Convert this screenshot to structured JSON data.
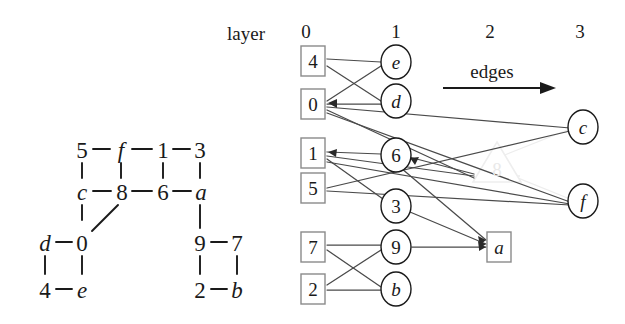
{
  "figure": {
    "labels": {
      "layer_word": "layer",
      "edges_word": "edges"
    },
    "layer_headers": [
      {
        "text": "0",
        "x": 306,
        "y": 31
      },
      {
        "text": "1",
        "x": 396,
        "y": 31
      },
      {
        "text": "2",
        "x": 490,
        "y": 31
      },
      {
        "text": "3",
        "x": 580,
        "y": 31
      }
    ],
    "layer_word_pos": {
      "x": 246,
      "y": 33
    },
    "edges_word_pos": {
      "x": 492,
      "y": 71
    },
    "edges_arrow": {
      "x1": 443,
      "y1": 88,
      "x2": 548,
      "y2": 88
    }
  },
  "left_graph": {
    "title": "undirected source graph",
    "nodes": [
      {
        "id": "5",
        "label": "5",
        "x": 82,
        "y": 150,
        "italic": false
      },
      {
        "id": "f",
        "label": "f",
        "x": 121,
        "y": 150,
        "italic": true
      },
      {
        "id": "1",
        "label": "1",
        "x": 163,
        "y": 150,
        "italic": false
      },
      {
        "id": "3",
        "label": "3",
        "x": 200,
        "y": 150,
        "italic": false
      },
      {
        "id": "c",
        "label": "c",
        "x": 82,
        "y": 192,
        "italic": true
      },
      {
        "id": "8",
        "label": "8",
        "x": 122,
        "y": 192,
        "italic": false
      },
      {
        "id": "6",
        "label": "6",
        "x": 163,
        "y": 192,
        "italic": false
      },
      {
        "id": "a",
        "label": "a",
        "x": 201,
        "y": 192,
        "italic": true
      },
      {
        "id": "d",
        "label": "d",
        "x": 45,
        "y": 243,
        "italic": true
      },
      {
        "id": "0",
        "label": "0",
        "x": 82,
        "y": 243,
        "italic": false
      },
      {
        "id": "9",
        "label": "9",
        "x": 200,
        "y": 243,
        "italic": false
      },
      {
        "id": "7",
        "label": "7",
        "x": 237,
        "y": 243,
        "italic": false
      },
      {
        "id": "4",
        "label": "4",
        "x": 45,
        "y": 290,
        "italic": false
      },
      {
        "id": "e",
        "label": "e",
        "x": 82,
        "y": 290,
        "italic": true
      },
      {
        "id": "2",
        "label": "2",
        "x": 200,
        "y": 290,
        "italic": false
      },
      {
        "id": "b",
        "label": "b",
        "x": 237,
        "y": 290,
        "italic": true
      }
    ],
    "edges": [
      [
        "5",
        "f"
      ],
      [
        "f",
        "1"
      ],
      [
        "1",
        "3"
      ],
      [
        "5",
        "c"
      ],
      [
        "f",
        "8"
      ],
      [
        "1",
        "6"
      ],
      [
        "3",
        "a"
      ],
      [
        "c",
        "8"
      ],
      [
        "8",
        "6"
      ],
      [
        "6",
        "a"
      ],
      [
        "c",
        "d_col"
      ],
      [
        "8",
        "0"
      ],
      [
        "a",
        "9"
      ],
      [
        "d",
        "0"
      ],
      [
        "9",
        "7"
      ],
      [
        "d",
        "4"
      ],
      [
        "0",
        "e"
      ],
      [
        "9",
        "2"
      ],
      [
        "7",
        "b"
      ],
      [
        "4",
        "e"
      ],
      [
        "2",
        "b"
      ]
    ]
  },
  "layered_graph": {
    "title": "layered drawing",
    "nodes": [
      {
        "id": "n4",
        "label": "4",
        "shape": "box",
        "layer": 0,
        "x": 312,
        "y": 61,
        "italic": false,
        "faint": false
      },
      {
        "id": "n0",
        "label": "0",
        "shape": "box",
        "layer": 0,
        "x": 312,
        "y": 104,
        "italic": false,
        "faint": false
      },
      {
        "id": "n1",
        "label": "1",
        "shape": "box",
        "layer": 0,
        "x": 312,
        "y": 153,
        "italic": false,
        "faint": false
      },
      {
        "id": "n5",
        "label": "5",
        "shape": "box",
        "layer": 0,
        "x": 312,
        "y": 188,
        "italic": false,
        "faint": false
      },
      {
        "id": "n7",
        "label": "7",
        "shape": "box",
        "layer": 0,
        "x": 312,
        "y": 247,
        "italic": false,
        "faint": false
      },
      {
        "id": "n2",
        "label": "2",
        "shape": "box",
        "layer": 0,
        "x": 312,
        "y": 289,
        "italic": false,
        "faint": false
      },
      {
        "id": "ne",
        "label": "e",
        "shape": "ellipse",
        "layer": 1,
        "x": 396,
        "y": 62,
        "italic": true,
        "faint": false
      },
      {
        "id": "nd",
        "label": "d",
        "shape": "ellipse",
        "layer": 1,
        "x": 396,
        "y": 101,
        "italic": true,
        "faint": false
      },
      {
        "id": "n6",
        "label": "6",
        "shape": "ellipse",
        "layer": 1,
        "x": 396,
        "y": 155,
        "italic": false,
        "faint": false
      },
      {
        "id": "n3",
        "label": "3",
        "shape": "ellipse",
        "layer": 1,
        "x": 396,
        "y": 206,
        "italic": false,
        "faint": false
      },
      {
        "id": "n9",
        "label": "9",
        "shape": "ellipse",
        "layer": 1,
        "x": 396,
        "y": 247,
        "italic": false,
        "faint": false
      },
      {
        "id": "nb",
        "label": "b",
        "shape": "ellipse",
        "layer": 1,
        "x": 396,
        "y": 289,
        "italic": true,
        "faint": false
      },
      {
        "id": "n8",
        "label": "8",
        "shape": "triangle",
        "layer": 2,
        "x": 497,
        "y": 165,
        "italic": false,
        "faint": true
      },
      {
        "id": "na",
        "label": "a",
        "shape": "box",
        "layer": 2,
        "x": 499,
        "y": 247,
        "italic": true,
        "faint": false
      },
      {
        "id": "nc",
        "label": "c",
        "shape": "ellipse",
        "layer": 3,
        "x": 583,
        "y": 127,
        "italic": true,
        "faint": false
      },
      {
        "id": "nf",
        "label": "f",
        "shape": "ellipse",
        "layer": 3,
        "x": 583,
        "y": 201,
        "italic": true,
        "faint": false
      }
    ],
    "edges": [
      {
        "from": "n4",
        "to": "ne",
        "faint": false
      },
      {
        "from": "n4",
        "to": "nd",
        "faint": false
      },
      {
        "from": "n0",
        "to": "ne",
        "faint": false
      },
      {
        "from": "n0",
        "to": "nd",
        "faint": false
      },
      {
        "from": "n0",
        "to": "nc",
        "faint": false
      },
      {
        "from": "n0",
        "to": "n8",
        "faint": false
      },
      {
        "from": "n0",
        "to": "nf",
        "faint": false
      },
      {
        "from": "n1",
        "to": "n6",
        "faint": false
      },
      {
        "from": "n1",
        "to": "n8",
        "faint": false
      },
      {
        "from": "n1",
        "to": "n3",
        "faint": false
      },
      {
        "from": "n1",
        "to": "nf",
        "faint": false
      },
      {
        "from": "n5",
        "to": "nc",
        "faint": false
      },
      {
        "from": "n5",
        "to": "n6",
        "faint": false
      },
      {
        "from": "n6",
        "to": "na",
        "faint": false
      },
      {
        "from": "n6",
        "to": "n8",
        "faint": false
      },
      {
        "from": "n3",
        "to": "na",
        "faint": false
      },
      {
        "from": "n9",
        "to": "na",
        "faint": false
      },
      {
        "from": "n7",
        "to": "n9",
        "faint": false
      },
      {
        "from": "n7",
        "to": "nb",
        "faint": false
      },
      {
        "from": "n2",
        "to": "n9",
        "faint": false
      },
      {
        "from": "n2",
        "to": "nb",
        "faint": false
      },
      {
        "from": "n8",
        "to": "nc",
        "faint": true
      },
      {
        "from": "n8",
        "to": "nf",
        "faint": true
      }
    ]
  },
  "colors": {
    "ink": "#1a1a1a",
    "edge": "#555555",
    "node_stroke": "#777777",
    "faint": "#ebebeb",
    "background": "#ffffff"
  }
}
